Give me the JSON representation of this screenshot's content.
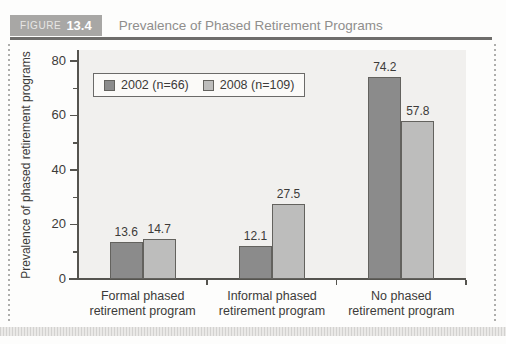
{
  "figure": {
    "label_word": "FIGURE",
    "label_number": "13.4",
    "title": "Prevalence of Phased Retirement Programs"
  },
  "chart_data": {
    "type": "bar",
    "title": "Prevalence of Phased Retirement Programs",
    "categories": [
      "Formal phased\nretirement program",
      "Informal phased\nretirement program",
      "No phased\nretirement program"
    ],
    "series": [
      {
        "name": "2002 (n=66)",
        "values": [
          13.6,
          12.1,
          74.2
        ],
        "color": "#8b8b8b"
      },
      {
        "name": "2008 (n=109)",
        "values": [
          14.7,
          27.5,
          57.8
        ],
        "color": "#bdbdbc"
      }
    ],
    "xlabel": "",
    "ylabel": "Prevalence of phased retirement programs",
    "yticks": [
      0,
      20,
      40,
      60,
      80
    ],
    "minor_yticks": [
      10,
      30,
      50,
      70
    ],
    "ylim": [
      0,
      84
    ],
    "grid": false,
    "value_labels": true,
    "legend_position": "top-left"
  },
  "colors": {
    "plot_background": "#f1f0ee",
    "axis": "#55544f",
    "text": "#3c3b39",
    "header_box": "#a8a7a5",
    "header_rule": "#6e6d6b",
    "title_text": "#8f8e8c",
    "bar_2002": "#8b8b8b",
    "bar_2008": "#bdbdbc",
    "bar_border": "#63625e"
  }
}
